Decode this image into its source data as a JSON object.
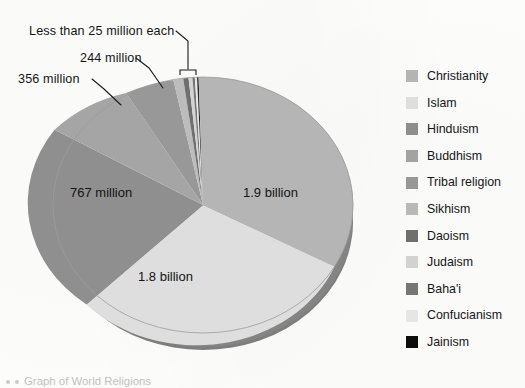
{
  "figure": {
    "caption": "Graph of World Religions",
    "callouts": [
      {
        "id": "less",
        "text": "Less than 25 million each"
      },
      {
        "id": "c244",
        "text": "244 million"
      },
      {
        "id": "c356",
        "text": "356 million"
      }
    ],
    "slice_labels": [
      {
        "id": "christianity",
        "text": "1.9 billion"
      },
      {
        "id": "islam",
        "text": "1.8 billion"
      },
      {
        "id": "hinduism",
        "text": "767 million"
      }
    ]
  },
  "legend": {
    "items": [
      {
        "label": "Christianity",
        "color": "#b4b4b4"
      },
      {
        "label": "Islam",
        "color": "#dedede"
      },
      {
        "label": "Hinduism",
        "color": "#8e8e8e"
      },
      {
        "label": "Buddhism",
        "color": "#a3a3a3"
      },
      {
        "label": "Tribal religion",
        "color": "#979797"
      },
      {
        "label": "Sikhism",
        "color": "#b9b9b9"
      },
      {
        "label": "Daoism",
        "color": "#6f6f6f"
      },
      {
        "label": "Judaism",
        "color": "#d2d2d2"
      },
      {
        "label": "Baha'i",
        "color": "#767676"
      },
      {
        "label": "Confucianism",
        "color": "#e6e6e6"
      },
      {
        "label": "Jainism",
        "color": "#0d0d0d"
      }
    ]
  },
  "chart_data": {
    "type": "pie",
    "title": "Graph of World Religions",
    "units": "adherents",
    "legend_position": "right",
    "three_d": true,
    "depth_color": "#7e7e7e",
    "categories": [
      "Christianity",
      "Islam",
      "Hinduism",
      "Buddhism",
      "Tribal religion",
      "Sikhism",
      "Daoism",
      "Judaism",
      "Baha'i",
      "Confucianism",
      "Jainism"
    ],
    "values": [
      1900,
      1800,
      767,
      356,
      244,
      23,
      20,
      14,
      7,
      6,
      4
    ],
    "value_unit": "millions",
    "display_labels": [
      "1.9 billion",
      "1.8 billion",
      "767 million",
      "356 million",
      "244 million",
      "Less than 25 million each",
      "",
      "",
      "",
      "",
      ""
    ],
    "colors": [
      "#b4b4b4",
      "#dedede",
      "#8e8e8e",
      "#a3a3a3",
      "#979797",
      "#b9b9b9",
      "#6f6f6f",
      "#d2d2d2",
      "#767676",
      "#e6e6e6",
      "#0d0d0d"
    ],
    "start_angle_deg": 0,
    "direction": "clockwise",
    "grouped_note": "Sikhism, Daoism, Judaism, Baha'i, Confucianism and Jainism each have fewer than 25 million adherents and appear as thin slivers."
  }
}
